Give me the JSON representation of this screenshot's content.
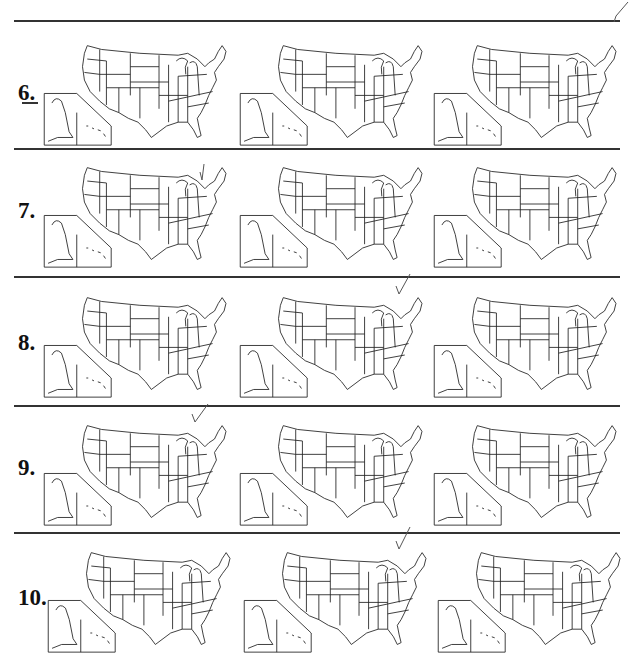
{
  "worksheet": {
    "rows": [
      {
        "number": "6.",
        "maps": 3,
        "checked_map": null,
        "marker": "dash"
      },
      {
        "number": "7.",
        "maps": 3,
        "checked_map": 0
      },
      {
        "number": "8.",
        "maps": 3,
        "checked_map": 1
      },
      {
        "number": "9.",
        "maps": 3,
        "checked_map": 0
      },
      {
        "number": "10.",
        "maps": 3,
        "checked_map": 1
      }
    ],
    "top_right_check": true
  }
}
